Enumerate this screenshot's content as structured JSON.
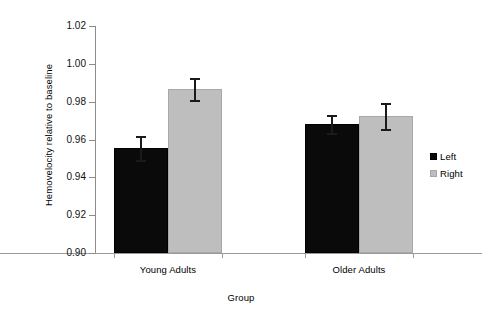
{
  "chart_data": {
    "type": "bar",
    "title": "",
    "subtitle": "",
    "xlabel": "Group",
    "ylabel": "Hemovelocity relative to baseline",
    "categories": [
      "Young Adults",
      "Older Adults"
    ],
    "ylim": [
      0.9,
      1.02
    ],
    "ytick_labels": [
      "1.02",
      "1.00",
      "0.98",
      "0.96",
      "0.94",
      "0.92",
      "0.90"
    ],
    "ytick_values": [
      1.02,
      1.0,
      0.98,
      0.96,
      0.94,
      0.92,
      0.9
    ],
    "grid": false,
    "legend_position": "right",
    "series": [
      {
        "name": "Left",
        "color": "#0a0a0a",
        "values": [
          0.9555,
          0.9682
        ],
        "errors": [
          0.0063,
          0.0048
        ]
      },
      {
        "name": "Right",
        "color": "#bebebe",
        "values": [
          0.9867,
          0.9724
        ],
        "errors": [
          0.0058,
          0.0069
        ]
      }
    ]
  },
  "legend": {
    "items": [
      {
        "label": "Left"
      },
      {
        "label": "Right"
      }
    ]
  },
  "axes": {
    "y_title": "Hemovelocity relative to baseline",
    "x_title": "Group"
  }
}
